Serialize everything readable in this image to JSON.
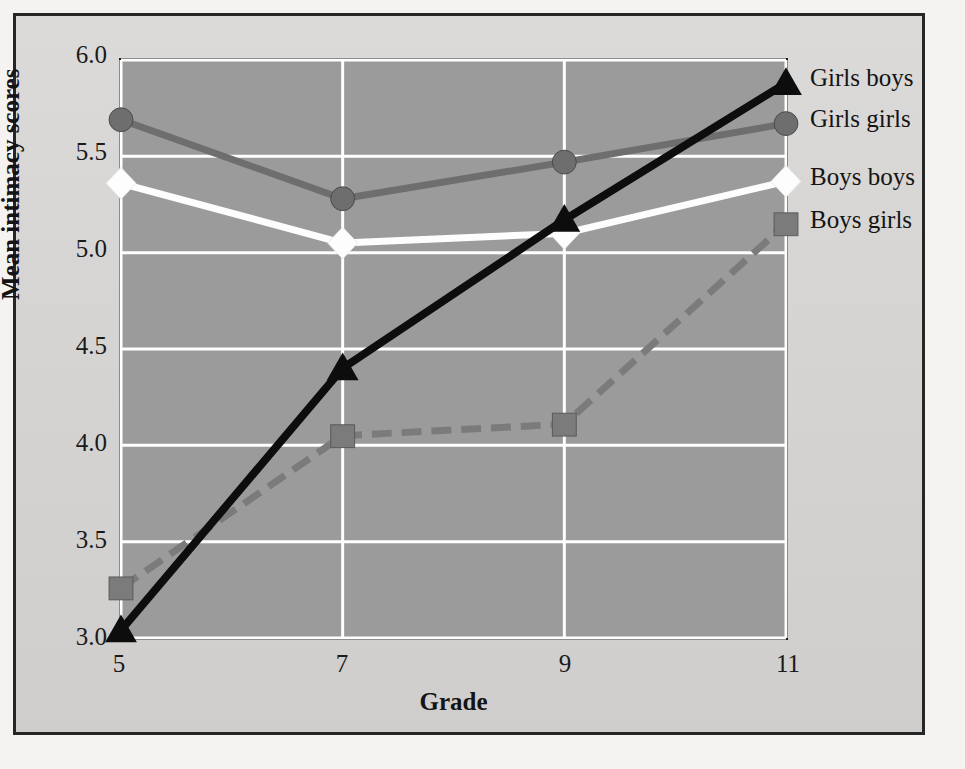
{
  "chart_data": {
    "type": "line",
    "title": "",
    "xlabel": "Grade",
    "ylabel": "Mean intimacy scores",
    "x": [
      5,
      7,
      9,
      11
    ],
    "xticklabels": [
      "5",
      "7",
      "9",
      "11"
    ],
    "yticklabels": [
      "3.0",
      "3.5",
      "4.0",
      "4.5",
      "5.0",
      "5.5",
      "6.0"
    ],
    "yticks": [
      3.0,
      3.5,
      4.0,
      4.5,
      5.0,
      5.5,
      6.0
    ],
    "ylim": [
      3.0,
      6.0
    ],
    "xlim": [
      5,
      11
    ],
    "grid": true,
    "grid_color": "#ffffff",
    "plot_background": "#9b9b9b",
    "figure_background": "#d6d5d3",
    "legend_position": "right-inline",
    "series": [
      {
        "name": "Girls boys",
        "values": [
          3.04,
          4.4,
          5.17,
          5.88
        ],
        "color": "#0d0d0d",
        "marker": "triangle",
        "linestyle": "solid"
      },
      {
        "name": "Girls girls",
        "values": [
          5.69,
          5.28,
          5.47,
          5.67
        ],
        "color": "#6e6e6e",
        "marker": "circle",
        "linestyle": "solid"
      },
      {
        "name": "Boys boys",
        "values": [
          5.36,
          5.05,
          5.1,
          5.37
        ],
        "color": "#fdfdfd",
        "marker": "diamond",
        "linestyle": "solid"
      },
      {
        "name": "Boys girls",
        "values": [
          3.26,
          4.05,
          4.11,
          5.15
        ],
        "color": "#7b7b7b",
        "marker": "square",
        "linestyle": "dashed"
      }
    ]
  },
  "legend": {
    "items": [
      {
        "label": "Girls boys"
      },
      {
        "label": "Girls girls"
      },
      {
        "label": "Boys boys"
      },
      {
        "label": "Boys girls"
      }
    ]
  },
  "axes": {
    "x_title": "Grade",
    "y_title": "Mean intimacy scores"
  }
}
